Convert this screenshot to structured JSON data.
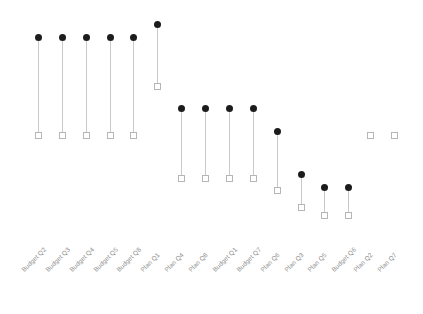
{
  "chart_data": {
    "type": "scatter",
    "subtype": "dumbbell",
    "title": "",
    "subtitle": "",
    "xlabel": "",
    "ylabel": "",
    "grid": false,
    "legend": null,
    "legend_position": "none",
    "axis_visible": false,
    "categories": [
      "Budget Q2",
      "Budget Q3",
      "Budget Q4",
      "Budget Q5",
      "Budget Q8",
      "Plan Q1",
      "Plan Q4",
      "Plan Q8",
      "Budget Q1",
      "Budget Q7",
      "Plan Q6",
      "Plan Q3",
      "Plan Q5",
      "Budget Q6",
      "Plan Q2",
      "Plan Q7"
    ],
    "series": [
      {
        "name": "High",
        "marker": "filled-circle",
        "color": "#1c1c1c",
        "values": [
          98,
          98,
          98,
          98,
          98,
          105,
          81,
          81,
          81,
          81,
          69,
          50,
          45,
          45,
          69,
          69
        ]
      },
      {
        "name": "Low",
        "marker": "open-square",
        "color": "#b6b6b6",
        "values": [
          69,
          69,
          69,
          69,
          69,
          81,
          50,
          50,
          50,
          50,
          44,
          36,
          32,
          32,
          69,
          69
        ]
      }
    ],
    "ylim": [
      20,
      115
    ],
    "connector_color": "#c9c9c9",
    "points": [
      {
        "category": "Budget Q2",
        "x": 38,
        "circle_y": 37,
        "square_y": 135
      },
      {
        "category": "Budget Q3",
        "x": 62,
        "circle_y": 37,
        "square_y": 135
      },
      {
        "category": "Budget Q4",
        "x": 86,
        "circle_y": 37,
        "square_y": 135
      },
      {
        "category": "Budget Q5",
        "x": 110,
        "circle_y": 37,
        "square_y": 135
      },
      {
        "category": "Budget Q8",
        "x": 133,
        "circle_y": 37,
        "square_y": 135
      },
      {
        "category": "Plan Q1",
        "x": 157,
        "circle_y": 24,
        "square_y": 86
      },
      {
        "category": "Plan Q4",
        "x": 181,
        "circle_y": 108,
        "square_y": 178
      },
      {
        "category": "Plan Q8",
        "x": 205,
        "circle_y": 108,
        "square_y": 178
      },
      {
        "category": "Budget Q1",
        "x": 229,
        "circle_y": 108,
        "square_y": 178
      },
      {
        "category": "Budget Q7",
        "x": 253,
        "circle_y": 108,
        "square_y": 178
      },
      {
        "category": "Plan Q6",
        "x": 277,
        "circle_y": 131,
        "square_y": 190
      },
      {
        "category": "Plan Q3",
        "x": 301,
        "circle_y": 174,
        "square_y": 207
      },
      {
        "category": "Plan Q5",
        "x": 324,
        "circle_y": 187,
        "square_y": 215
      },
      {
        "category": "Budget Q6",
        "x": 348,
        "circle_y": 187,
        "square_y": 215
      },
      {
        "category": "Plan Q2",
        "x": 370,
        "circle_y": 135,
        "square_y": 135
      },
      {
        "category": "Plan Q7",
        "x": 394,
        "circle_y": 135,
        "square_y": 135
      }
    ]
  },
  "watermarks": {
    "primary": "",
    "secondary": ""
  }
}
